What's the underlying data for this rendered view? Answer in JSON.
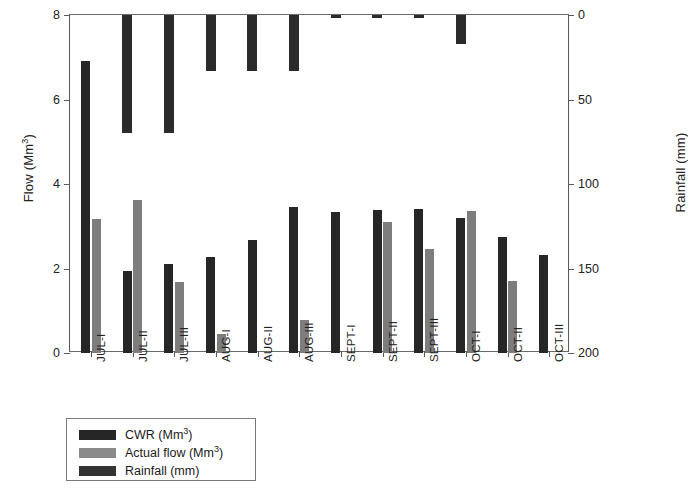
{
  "chart_data": {
    "type": "bar",
    "title": "",
    "xlabel": "",
    "ylabel": "Flow (Mm3)",
    "ylabel_main": "Flow (Mm",
    "ylabel_sup": "3",
    "ylabel_tail": ")",
    "y2label_main": "Rainfall (mm)",
    "categories": [
      "JUL-I",
      "JUL-II",
      "JUL-III",
      "AUG-I",
      "AUG-II",
      "AUG-III",
      "SEPT-I",
      "SEPT-II",
      "SEPT-III",
      "OCT-I",
      "OCT-II",
      "OCT-III"
    ],
    "ylim": [
      0,
      8
    ],
    "yticks": [
      0,
      2,
      4,
      6,
      8
    ],
    "ylim_right": [
      0,
      200
    ],
    "yticks_right": [
      0,
      50,
      100,
      150,
      200
    ],
    "right_axis_inverted": true,
    "grid": false,
    "legend_position": "below-axes-left",
    "series": [
      {
        "name": "CWR (Mm3)",
        "label_main": "CWR (Mm",
        "label_sup": "3",
        "label_tail": ")",
        "axis": "left",
        "color": "#262626",
        "values": [
          6.9,
          1.95,
          2.1,
          2.28,
          2.68,
          3.45,
          3.33,
          3.38,
          3.4,
          3.2,
          2.75,
          2.33
        ]
      },
      {
        "name": "Actual flow (Mm3)",
        "label_main": "Actual flow (Mm",
        "label_sup": "3",
        "label_tail": ")",
        "axis": "left",
        "color": "#7d7d7d",
        "values": [
          3.18,
          3.63,
          1.67,
          0.45,
          0.0,
          0.78,
          0.0,
          3.1,
          2.45,
          3.37,
          1.7,
          0.0
        ]
      },
      {
        "name": "Rainfall (mm)",
        "label_main": "Rainfall (mm)",
        "label_sup": "",
        "label_tail": "",
        "axis": "right",
        "color": "#2b2b2b",
        "values": [
          0,
          70,
          70,
          33,
          33,
          33,
          2,
          2,
          2,
          17,
          0,
          0
        ]
      }
    ]
  },
  "legend": {
    "items": [
      {
        "label_main": "CWR (Mm",
        "label_sup": "3",
        "label_tail": ")"
      },
      {
        "label_main": "Actual flow (Mm",
        "label_sup": "3",
        "label_tail": ")"
      },
      {
        "label_main": "Rainfall (mm)",
        "label_sup": "",
        "label_tail": ""
      }
    ]
  }
}
